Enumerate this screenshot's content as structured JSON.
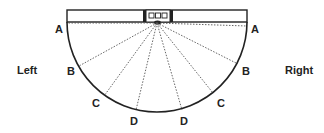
{
  "diagram": {
    "side_labels": {
      "left": "Left",
      "right": "Right"
    },
    "zones": [
      {
        "id": "A",
        "angle_deg": 0
      },
      {
        "id": "B",
        "angle_deg": 30
      },
      {
        "id": "C",
        "angle_deg": 55
      },
      {
        "id": "D",
        "angle_deg": 77
      }
    ],
    "zone_labels": {
      "left_A": "A",
      "left_B": "B",
      "left_C": "C",
      "left_D": "D",
      "right_A": "A",
      "right_B": "B",
      "right_C": "C",
      "right_D": "D"
    },
    "device": {
      "indicators": 3
    },
    "colors": {
      "line": "#222222",
      "dotted": "#555555",
      "background": "#ffffff"
    }
  }
}
